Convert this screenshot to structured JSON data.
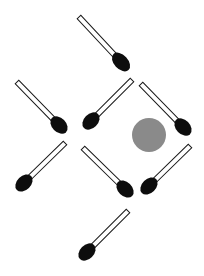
{
  "puzzle": {
    "type": "matchstick-puzzle",
    "match_count": 8,
    "colors": {
      "background": "#ffffff",
      "stick_fill": "#ffffff",
      "stick_outline": "#1a1a1a",
      "match_head": "#0d0d0d",
      "target_circle": "#8a8a8a"
    },
    "matches": [
      {
        "id": "match-1",
        "tail": [
          79,
          17
        ],
        "head": [
          121,
          62
        ],
        "head_rx": 11,
        "head_ry": 7
      },
      {
        "id": "match-2",
        "tail": [
          17,
          82
        ],
        "head": [
          59,
          125
        ],
        "head_rx": 10,
        "head_ry": 7
      },
      {
        "id": "match-3",
        "tail": [
          132,
          80
        ],
        "head": [
          91,
          121
        ],
        "head_rx": 10,
        "head_ry": 7
      },
      {
        "id": "match-4",
        "tail": [
          141,
          84
        ],
        "head": [
          183,
          127
        ],
        "head_rx": 10,
        "head_ry": 7
      },
      {
        "id": "match-5",
        "tail": [
          65,
          143
        ],
        "head": [
          24,
          183
        ],
        "head_rx": 10,
        "head_ry": 7
      },
      {
        "id": "match-6",
        "tail": [
          83,
          148
        ],
        "head": [
          125,
          189
        ],
        "head_rx": 10,
        "head_ry": 7
      },
      {
        "id": "match-7",
        "tail": [
          190,
          146
        ],
        "head": [
          149,
          186
        ],
        "head_rx": 10,
        "head_ry": 7
      },
      {
        "id": "match-8",
        "tail": [
          128,
          211
        ],
        "head": [
          87,
          252
        ],
        "head_rx": 10,
        "head_ry": 7
      }
    ],
    "target": {
      "cx": 149,
      "cy": 135,
      "r": 17
    }
  }
}
